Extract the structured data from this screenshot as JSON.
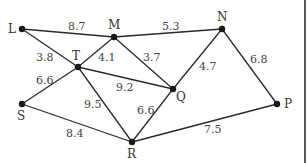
{
  "diagram": {
    "type": "weighted-graph",
    "nodes": [
      {
        "id": "L",
        "label": "L",
        "x": 22,
        "y": 29,
        "lx": 8,
        "ly": 33
      },
      {
        "id": "M",
        "label": "M",
        "x": 114,
        "y": 37,
        "lx": 108,
        "ly": 29
      },
      {
        "id": "N",
        "label": "N",
        "x": 222,
        "y": 29,
        "lx": 217,
        "ly": 21
      },
      {
        "id": "T",
        "label": "T",
        "x": 78,
        "y": 67,
        "lx": 72,
        "ly": 60
      },
      {
        "id": "Q",
        "label": "Q",
        "x": 173,
        "y": 89,
        "lx": 176,
        "ly": 101
      },
      {
        "id": "S",
        "label": "S",
        "x": 22,
        "y": 104,
        "lx": 17,
        "ly": 120
      },
      {
        "id": "R",
        "label": "R",
        "x": 132,
        "y": 142,
        "lx": 127,
        "ly": 158
      },
      {
        "id": "P",
        "label": "P",
        "x": 277,
        "y": 104,
        "lx": 284,
        "ly": 108
      }
    ],
    "edges": [
      {
        "from": "L",
        "to": "M",
        "weight": "8.7",
        "lx": 68,
        "ly": 30
      },
      {
        "from": "M",
        "to": "N",
        "weight": "5.3",
        "lx": 162,
        "ly": 30
      },
      {
        "from": "L",
        "to": "T",
        "weight": "3.8",
        "lx": 36,
        "ly": 61
      },
      {
        "from": "T",
        "to": "M",
        "weight": "4.1",
        "lx": 98,
        "ly": 61
      },
      {
        "from": "M",
        "to": "Q",
        "weight": "3.7",
        "lx": 143,
        "ly": 61
      },
      {
        "from": "N",
        "to": "Q",
        "weight": "4.7",
        "lx": 199,
        "ly": 70
      },
      {
        "from": "N",
        "to": "P",
        "weight": "6.8",
        "lx": 250,
        "ly": 63
      },
      {
        "from": "T",
        "to": "Q",
        "weight": "9.2",
        "lx": 116,
        "ly": 91
      },
      {
        "from": "S",
        "to": "T",
        "weight": "6.6",
        "lx": 36,
        "ly": 84
      },
      {
        "from": "T",
        "to": "R",
        "weight": "9.5",
        "lx": 84,
        "ly": 108
      },
      {
        "from": "Q",
        "to": "R",
        "weight": "6.6",
        "lx": 137,
        "ly": 114
      },
      {
        "from": "S",
        "to": "R",
        "weight": "8.4",
        "lx": 66,
        "ly": 137
      },
      {
        "from": "R",
        "to": "P",
        "weight": "7.5",
        "lx": 204,
        "ly": 133
      }
    ]
  }
}
